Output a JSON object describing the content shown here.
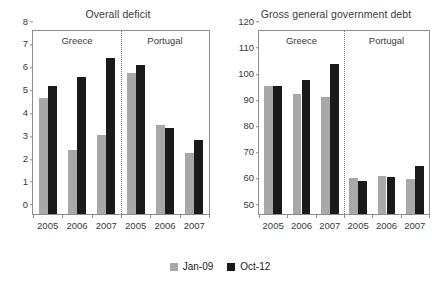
{
  "legend": {
    "position": "bottom-center",
    "entries": [
      {
        "label": "Jan-09",
        "color": "#a8a8a8",
        "name": "jan-09"
      },
      {
        "label": "Oct-12",
        "color": "#1a1a1a",
        "name": "oct-12"
      }
    ]
  },
  "chart_data": [
    {
      "type": "bar",
      "name": "overall-deficit",
      "title": "Overall deficit",
      "xlabel": "",
      "ylabel": "",
      "ylim": [
        0,
        8
      ],
      "yticks": [
        0,
        1,
        2,
        3,
        4,
        5,
        6,
        7,
        8
      ],
      "ytick_labels": [
        "0",
        "1",
        "2",
        "3",
        "4",
        "5",
        "6",
        "7",
        "8"
      ],
      "grid": false,
      "groups": [
        "Greece",
        "Portugal"
      ],
      "categories": [
        "2005",
        "2006",
        "2007",
        "2005",
        "2006",
        "2007"
      ],
      "series": [
        {
          "name": "Jan-09",
          "color": "#a8a8a8",
          "values": [
            5.05,
            2.8,
            3.45,
            6.15,
            3.88,
            2.65
          ]
        },
        {
          "name": "Oct-12",
          "color": "#1a1a1a",
          "values": [
            5.6,
            6.0,
            6.8,
            6.5,
            3.78,
            3.25
          ]
        }
      ]
    },
    {
      "type": "bar",
      "name": "gross-general-government-debt",
      "title": "Gross general government debt",
      "xlabel": "",
      "ylabel": "",
      "ylim": [
        50,
        120
      ],
      "yticks": [
        50,
        60,
        70,
        80,
        90,
        100,
        110,
        120
      ],
      "ytick_labels": [
        "50",
        "60",
        "70",
        "80",
        "90",
        "100",
        "110",
        "120"
      ],
      "grid": false,
      "groups": [
        "Greece",
        "Portugal"
      ],
      "categories": [
        "2005",
        "2006",
        "2007",
        "2005",
        "2006",
        "2007"
      ],
      "series": [
        {
          "name": "Jan-09",
          "color": "#a8a8a8",
          "values": [
            98.8,
            95.8,
            94.9,
            63.8,
            64.7,
            63.5
          ]
        },
        {
          "name": "Oct-12",
          "color": "#1a1a1a",
          "values": [
            98.8,
            101.3,
            107.5,
            62.6,
            64.0,
            68.5
          ]
        }
      ]
    }
  ]
}
